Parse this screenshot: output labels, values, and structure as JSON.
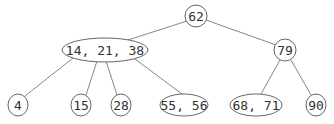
{
  "diagram": {
    "type": "tree",
    "nodes": [
      {
        "id": "n62",
        "label": "62",
        "cx": 196,
        "cy": 16,
        "rx": 11,
        "ry": 11
      },
      {
        "id": "n14_21_38",
        "label": "14, 21, 38",
        "cx": 105,
        "cy": 50,
        "rx": 43,
        "ry": 12
      },
      {
        "id": "n79",
        "label": "79",
        "cx": 285,
        "cy": 50,
        "rx": 11,
        "ry": 11
      },
      {
        "id": "n4",
        "label": "4",
        "cx": 18,
        "cy": 105,
        "rx": 10,
        "ry": 11
      },
      {
        "id": "n15",
        "label": "15",
        "cx": 81,
        "cy": 105,
        "rx": 10,
        "ry": 11
      },
      {
        "id": "n28",
        "label": "28",
        "cx": 121,
        "cy": 105,
        "rx": 10,
        "ry": 11
      },
      {
        "id": "n55_56",
        "label": "55, 56",
        "cx": 184,
        "cy": 105,
        "rx": 24,
        "ry": 11
      },
      {
        "id": "n68_71",
        "label": "68, 71",
        "cx": 256,
        "cy": 105,
        "rx": 26,
        "ry": 11
      },
      {
        "id": "n90",
        "label": "90",
        "cx": 316,
        "cy": 105,
        "rx": 10,
        "ry": 11
      }
    ],
    "edges": [
      {
        "from": "n62",
        "to": "n14_21_38",
        "x1": 187,
        "y1": 21,
        "x2": 128,
        "y2": 40
      },
      {
        "from": "n62",
        "to": "n79",
        "x1": 206,
        "y1": 20,
        "x2": 276,
        "y2": 45
      },
      {
        "from": "n14_21_38",
        "to": "n4",
        "x1": 73,
        "y1": 58,
        "x2": 25,
        "y2": 96
      },
      {
        "from": "n14_21_38",
        "to": "n15",
        "x1": 97,
        "y1": 61,
        "x2": 86,
        "y2": 95
      },
      {
        "from": "n14_21_38",
        "to": "n28",
        "x1": 106,
        "y1": 61,
        "x2": 117,
        "y2": 95
      },
      {
        "from": "n14_21_38",
        "to": "n55_56",
        "x1": 135,
        "y1": 59,
        "x2": 182,
        "y2": 94
      },
      {
        "from": "n79",
        "to": "n68_71",
        "x1": 280,
        "y1": 60,
        "x2": 261,
        "y2": 94
      },
      {
        "from": "n79",
        "to": "n90",
        "x1": 291,
        "y1": 60,
        "x2": 311,
        "y2": 95
      }
    ]
  }
}
